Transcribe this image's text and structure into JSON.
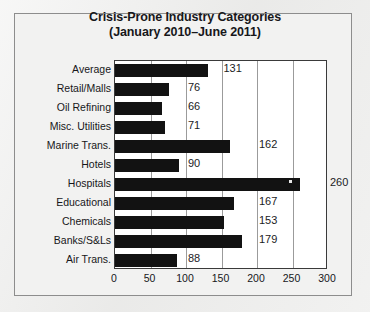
{
  "chart_data": {
    "type": "bar",
    "orientation": "horizontal",
    "title": "Crisis-Prone Industry Categories",
    "subtitle": "(January 2010–June 2011)",
    "xlabel": "",
    "ylabel": "",
    "xlim": [
      0,
      300
    ],
    "xticks": [
      0,
      50,
      100,
      150,
      200,
      250,
      300
    ],
    "grid": true,
    "legend": false,
    "bar_color": "#121212",
    "plot_background": "#ffffff",
    "gridline_color": "#9b9b9b",
    "categories": [
      "Average",
      "Retail/Malls",
      "Oil Refining",
      "Misc. Utilities",
      "Marine Trans.",
      "Hotels",
      "Hospitals",
      "Educational",
      "Chemicals",
      "Banks/S&Ls",
      "Air Trans."
    ],
    "values": [
      131,
      76,
      66,
      71,
      162,
      90,
      260,
      167,
      153,
      179,
      88
    ],
    "value_labels": [
      "131",
      "76",
      "66",
      "71",
      "162",
      "90",
      "260",
      "167",
      "153",
      "179",
      "88"
    ]
  }
}
